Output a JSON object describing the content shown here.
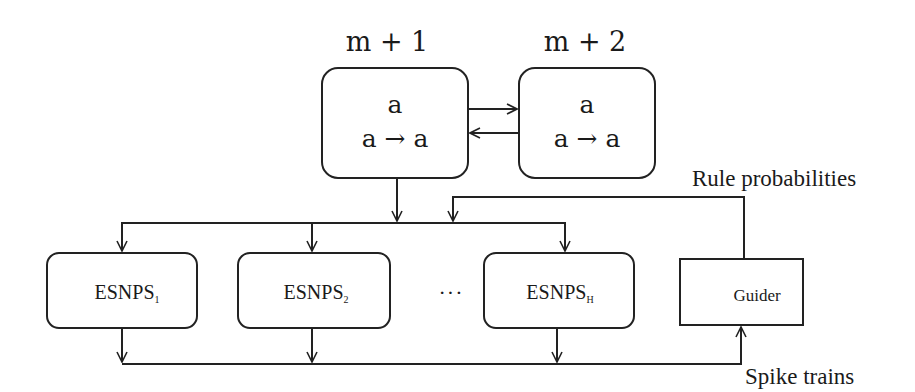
{
  "diagram": {
    "neurons": [
      {
        "id": "m1",
        "label": "m + 1",
        "content": "a",
        "rule": "a → a"
      },
      {
        "id": "m2",
        "label": "m + 2",
        "content": "a",
        "rule": "a → a"
      }
    ],
    "esnps": [
      {
        "name": "ESNPS",
        "subscript": "1"
      },
      {
        "name": "ESNPS",
        "subscript": "2"
      },
      {
        "name": "ESNPS",
        "subscript": "H"
      }
    ],
    "ellipsis": "···",
    "guider": "Guider",
    "rule_probabilities": "Rule probabilities",
    "spike_trains": "Spike trains",
    "colors": {
      "stroke": "#222222",
      "background": "#ffffff"
    }
  }
}
